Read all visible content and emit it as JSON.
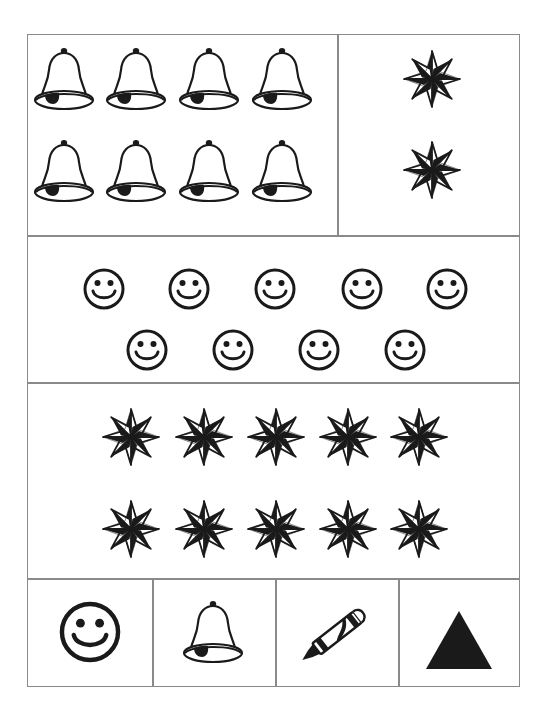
{
  "worksheet": {
    "colors": {
      "ink": "#1a1a1a",
      "border": "#8a8a8a",
      "paper": "#ffffff"
    },
    "sections": [
      {
        "id": "bells-and-stars",
        "left_panel": {
          "icon": "bell-icon",
          "count": 8,
          "rows": 2,
          "per_row": 4
        },
        "right_panel": {
          "icon": "star-icon",
          "count": 2,
          "rows": 2,
          "per_row": 1
        }
      },
      {
        "id": "smileys",
        "icon": "smiley-icon",
        "count": 9,
        "rows": [
          5,
          4
        ]
      },
      {
        "id": "stars",
        "icon": "star-icon",
        "count": 10,
        "rows": [
          5,
          5
        ]
      },
      {
        "id": "answer-key",
        "cells": [
          {
            "icon": "smiley-icon"
          },
          {
            "icon": "bell-icon"
          },
          {
            "icon": "crayon-icon"
          },
          {
            "icon": "triangle-icon"
          }
        ]
      }
    ]
  }
}
